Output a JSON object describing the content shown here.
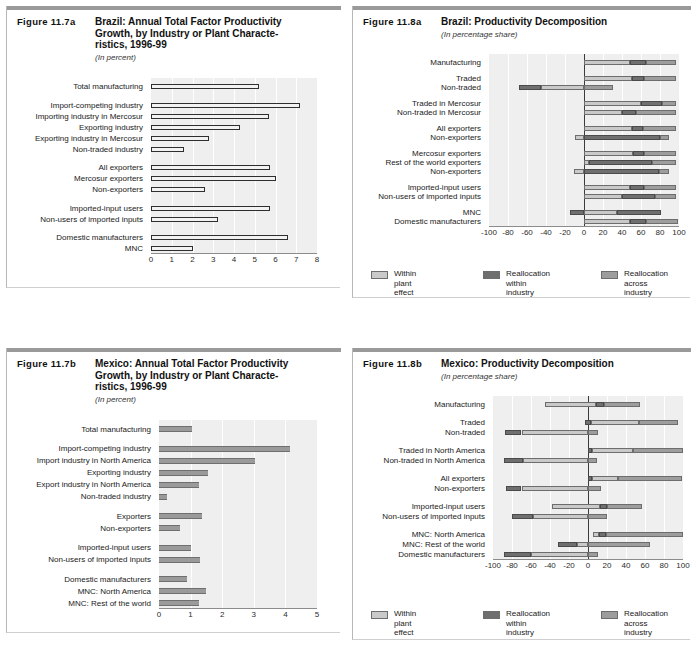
{
  "legend": {
    "items": [
      {
        "label": "Within plant effect",
        "color": "#c9c9c9",
        "key": "within"
      },
      {
        "label": "Reallocation\nwithin industry",
        "color": "#6f6f6f",
        "key": "realloc-within"
      },
      {
        "label": "Reallocation\nacross industry",
        "color": "#9d9d9d",
        "key": "realloc-across"
      }
    ]
  },
  "panels": [
    {
      "id": "fig-11-7a",
      "figure_number": "Figure 11.7a",
      "title": "Brazil: Annual Total Factor Productivity Growth, by Industry or Plant Characte-ristics, 1996-99",
      "title_lines": [
        "Brazil: Annual Total Factor Productivity",
        "Growth, by Industry or Plant Characte-",
        "ristics, 1996-99"
      ],
      "subtitle": "(In percent)",
      "chart_data": {
        "type": "bar",
        "orientation": "horizontal",
        "title": "Brazil: Annual Total Factor Productivity Growth, by Industry or Plant Characteristics, 1996-99",
        "xlabel": "",
        "ylabel": "",
        "unit": "In percent",
        "xlim": [
          0,
          8
        ],
        "xticks": [
          0,
          1,
          2,
          3,
          4,
          5,
          6,
          7,
          8
        ],
        "grid": true,
        "style": "hollow-outline",
        "categories": [
          "Total manufacturing",
          "Import-competing industry",
          "Importing industry in Mercosur",
          "Exporting industry",
          "Exporting industry in Mercosur",
          "Non-traded industry",
          "All exporters",
          "Mercosur exporters",
          "Non-exporters",
          "Imported-input users",
          "Non-users of imported inputs",
          "Domestic manufacturers",
          "MNC"
        ],
        "values": [
          5.2,
          7.2,
          5.7,
          4.3,
          2.8,
          1.6,
          5.75,
          6.0,
          2.6,
          5.75,
          3.25,
          6.6,
          2.0
        ],
        "group_breaks": [
          1,
          6,
          9,
          11
        ]
      }
    },
    {
      "id": "fig-11-8a",
      "figure_number": "Figure 11.8a",
      "title": "Brazil: Productivity Decomposition",
      "title_lines": [
        "Brazil: Productivity Decomposition"
      ],
      "subtitle": "(In percentage share)",
      "chart_data": {
        "type": "bar",
        "orientation": "horizontal",
        "stacked": true,
        "title": "Brazil: Productivity Decomposition",
        "xlabel": "",
        "ylabel": "",
        "unit": "In percentage share",
        "xlim": [
          -100,
          100
        ],
        "xticks": [
          -100,
          -80,
          -60,
          -40,
          -20,
          0,
          20,
          40,
          60,
          80,
          100
        ],
        "grid": true,
        "series": [
          {
            "name": "Within plant effect",
            "key": "within"
          },
          {
            "name": "Reallocation within industry",
            "key": "realloc-within"
          },
          {
            "name": "Reallocation across industry",
            "key": "realloc-across"
          }
        ],
        "categories": [
          "Manufacturing",
          "Traded",
          "Non-traded",
          "Traded in Mercosur",
          "Non-traded in Mercosur",
          "All exporters",
          "Non-exporters",
          "Mercosur exporters",
          "Rest of the world exporters",
          "Non-exporters",
          "Imported-input users",
          "Non-users of imported inputs",
          "MNC",
          "Domestic manufacturers"
        ],
        "stacks": [
          [
            {
              "key": "within",
              "from": 0,
              "to": 48
            },
            {
              "key": "realloc-within",
              "from": 48,
              "to": 65
            },
            {
              "key": "realloc-across",
              "from": 65,
              "to": 97
            }
          ],
          [
            {
              "key": "within",
              "from": 0,
              "to": 50
            },
            {
              "key": "realloc-within",
              "from": 50,
              "to": 63
            },
            {
              "key": "realloc-across",
              "from": 63,
              "to": 97
            }
          ],
          [
            {
              "key": "realloc-within",
              "from": -68,
              "to": -45
            },
            {
              "key": "within",
              "from": -45,
              "to": 0
            },
            {
              "key": "realloc-across",
              "from": 0,
              "to": 30
            }
          ],
          [
            {
              "key": "within",
              "from": 0,
              "to": 60
            },
            {
              "key": "realloc-within",
              "from": 60,
              "to": 82
            },
            {
              "key": "realloc-across",
              "from": 82,
              "to": 97
            }
          ],
          [
            {
              "key": "within",
              "from": 0,
              "to": 40
            },
            {
              "key": "realloc-within",
              "from": 40,
              "to": 55
            },
            {
              "key": "realloc-across",
              "from": 55,
              "to": 97
            }
          ],
          [
            {
              "key": "within",
              "from": 0,
              "to": 50
            },
            {
              "key": "realloc-within",
              "from": 50,
              "to": 62
            },
            {
              "key": "realloc-across",
              "from": 62,
              "to": 97
            }
          ],
          [
            {
              "key": "within",
              "from": -10,
              "to": 0
            },
            {
              "key": "realloc-within",
              "from": 0,
              "to": 80
            },
            {
              "key": "realloc-across",
              "from": 80,
              "to": 89
            }
          ],
          [
            {
              "key": "within",
              "from": 0,
              "to": 52
            },
            {
              "key": "realloc-within",
              "from": 52,
              "to": 63
            },
            {
              "key": "realloc-across",
              "from": 63,
              "to": 97
            }
          ],
          [
            {
              "key": "within",
              "from": 0,
              "to": 5
            },
            {
              "key": "realloc-within",
              "from": 5,
              "to": 72
            },
            {
              "key": "realloc-across",
              "from": 72,
              "to": 97
            }
          ],
          [
            {
              "key": "within",
              "from": -11,
              "to": 0
            },
            {
              "key": "realloc-within",
              "from": 0,
              "to": 79
            },
            {
              "key": "realloc-across",
              "from": 79,
              "to": 89
            }
          ],
          [
            {
              "key": "within",
              "from": 0,
              "to": 48
            },
            {
              "key": "realloc-within",
              "from": 48,
              "to": 63
            },
            {
              "key": "realloc-across",
              "from": 63,
              "to": 97
            }
          ],
          [
            {
              "key": "within",
              "from": 0,
              "to": 40
            },
            {
              "key": "realloc-within",
              "from": 40,
              "to": 75
            },
            {
              "key": "realloc-across",
              "from": 75,
              "to": 97
            }
          ],
          [
            {
              "key": "realloc-within",
              "from": -15,
              "to": 0
            },
            {
              "key": "within",
              "from": 0,
              "to": 35
            },
            {
              "key": "realloc-within",
              "from": 35,
              "to": 81
            }
          ],
          [
            {
              "key": "within",
              "from": 0,
              "to": 48
            },
            {
              "key": "realloc-within",
              "from": 48,
              "to": 65
            },
            {
              "key": "realloc-across",
              "from": 65,
              "to": 99
            }
          ]
        ],
        "group_breaks": [
          1,
          3,
          5,
          7,
          10,
          12
        ]
      }
    },
    {
      "id": "fig-11-7b",
      "figure_number": "Figure 11.7b",
      "title": "Mexico: Annual Total Factor Productivity Growth, by Industry or Plant Characte-ristics, 1996-99",
      "title_lines": [
        "Mexico: Annual Total Factor Productivity",
        "Growth, by Industry or Plant Characte-",
        "ristics, 1996-99"
      ],
      "subtitle": "(In percent)",
      "chart_data": {
        "type": "bar",
        "orientation": "horizontal",
        "title": "Mexico: Annual Total Factor Productivity Growth, by Industry or Plant Characteristics, 1996-99",
        "xlabel": "",
        "ylabel": "",
        "unit": "In percent",
        "xlim": [
          0,
          5
        ],
        "xticks": [
          0,
          1,
          2,
          3,
          4,
          5
        ],
        "grid": true,
        "style": "solid-gray",
        "categories": [
          "Total manufacturing",
          "Import-competing industry",
          "Import industry in North America",
          "Exporting industry",
          "Export industry in North America",
          "Non-traded industry",
          "Exporters",
          "Non-exporters",
          "Imported-input users",
          "Non-users of imported inputs",
          "Domestic manufacturers",
          "MNC: North America",
          "MNC: Rest of the world"
        ],
        "values": [
          1.05,
          4.15,
          3.05,
          1.55,
          1.25,
          0.25,
          1.35,
          0.65,
          1.0,
          1.3,
          0.9,
          1.5,
          1.25
        ],
        "group_breaks": [
          1,
          6,
          8,
          10
        ]
      }
    },
    {
      "id": "fig-11-8b",
      "figure_number": "Figure 11.8b",
      "title": "Mexico: Productivity Decomposition",
      "title_lines": [
        "Mexico: Productivity Decomposition"
      ],
      "subtitle": "(In percentage share)",
      "chart_data": {
        "type": "bar",
        "orientation": "horizontal",
        "stacked": true,
        "title": "Mexico: Productivity Decomposition",
        "xlabel": "",
        "ylabel": "",
        "unit": "In percentage share",
        "xlim": [
          -100,
          100
        ],
        "xticks": [
          -100,
          -80,
          -60,
          -40,
          -20,
          0,
          20,
          40,
          60,
          80,
          100
        ],
        "grid": true,
        "series": [
          {
            "name": "Within plant effect",
            "key": "within"
          },
          {
            "name": "Reallocation within industry",
            "key": "realloc-within"
          },
          {
            "name": "Reallocation across industry",
            "key": "realloc-across"
          }
        ],
        "categories": [
          "Manufacturing",
          "Traded",
          "Non-traded",
          "Traded in North America",
          "Non-traded in North America",
          "All exporters",
          "Non-exporters",
          "Imported-input users",
          "Non-users of imported inputs",
          "MNC: North America",
          "MNC: Rest of the world",
          "Domestic manufacturers"
        ],
        "stacks": [
          [
            {
              "key": "within",
              "from": -45,
              "to": 8
            },
            {
              "key": "realloc-within",
              "from": 8,
              "to": 17
            },
            {
              "key": "realloc-across",
              "from": 17,
              "to": 55
            }
          ],
          [
            {
              "key": "realloc-within",
              "from": -3,
              "to": 3
            },
            {
              "key": "within",
              "from": 3,
              "to": 54
            },
            {
              "key": "realloc-across",
              "from": 54,
              "to": 95
            }
          ],
          [
            {
              "key": "realloc-within",
              "from": -87,
              "to": -70
            },
            {
              "key": "within",
              "from": -70,
              "to": 0
            },
            {
              "key": "realloc-across",
              "from": 0,
              "to": 10
            }
          ],
          [
            {
              "key": "realloc-within",
              "from": 0,
              "to": 4
            },
            {
              "key": "within",
              "from": 4,
              "to": 47
            },
            {
              "key": "realloc-across",
              "from": 47,
              "to": 100
            }
          ],
          [
            {
              "key": "realloc-within",
              "from": -88,
              "to": -68
            },
            {
              "key": "within",
              "from": -68,
              "to": 0
            },
            {
              "key": "realloc-across",
              "from": 0,
              "to": 9
            }
          ],
          [
            {
              "key": "realloc-within",
              "from": 0,
              "to": 4
            },
            {
              "key": "within",
              "from": 4,
              "to": 32
            },
            {
              "key": "realloc-across",
              "from": 32,
              "to": 99
            }
          ],
          [
            {
              "key": "realloc-within",
              "from": -86,
              "to": -70
            },
            {
              "key": "within",
              "from": -70,
              "to": 0
            },
            {
              "key": "realloc-across",
              "from": 0,
              "to": 14
            }
          ],
          [
            {
              "key": "within",
              "from": -38,
              "to": 13
            },
            {
              "key": "realloc-within",
              "from": 13,
              "to": 20
            },
            {
              "key": "realloc-across",
              "from": 20,
              "to": 57
            }
          ],
          [
            {
              "key": "realloc-within",
              "from": -80,
              "to": -58
            },
            {
              "key": "within",
              "from": -58,
              "to": 0
            },
            {
              "key": "realloc-across",
              "from": 0,
              "to": 20
            }
          ],
          [
            {
              "key": "within",
              "from": 5,
              "to": 12
            },
            {
              "key": "realloc-within",
              "from": 12,
              "to": 19
            },
            {
              "key": "realloc-across",
              "from": 19,
              "to": 100
            }
          ],
          [
            {
              "key": "realloc-within",
              "from": -32,
              "to": -12
            },
            {
              "key": "within",
              "from": -12,
              "to": 0
            },
            {
              "key": "realloc-across",
              "from": 0,
              "to": 65
            }
          ],
          [
            {
              "key": "realloc-within",
              "from": -88,
              "to": -60
            },
            {
              "key": "within",
              "from": -60,
              "to": 0
            },
            {
              "key": "realloc-across",
              "from": 0,
              "to": 10
            }
          ]
        ],
        "group_breaks": [
          1,
          3,
          5,
          7,
          9
        ]
      }
    }
  ]
}
